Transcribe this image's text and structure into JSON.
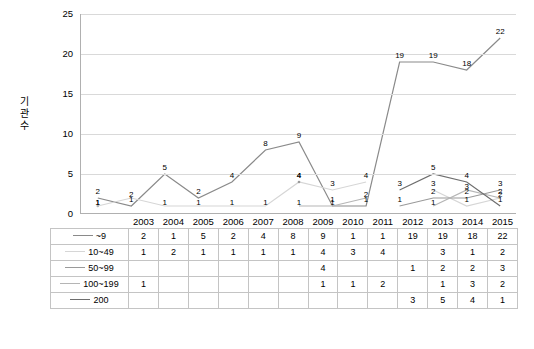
{
  "chart_data": {
    "type": "line",
    "title": "",
    "xlabel": "",
    "ylabel": "기관 수",
    "ylim": [
      0,
      25
    ],
    "yticks": [
      0,
      5,
      10,
      15,
      20,
      25
    ],
    "grid": true,
    "legend_position": "table-left",
    "categories": [
      "2003",
      "2004",
      "2005",
      "2006",
      "2007",
      "2008",
      "2009",
      "2010",
      "2011",
      "2012",
      "2013",
      "2014",
      "2015"
    ],
    "series": [
      {
        "name": "~9",
        "color": "#8a8a8a",
        "values": [
          2,
          1,
          5,
          2,
          4,
          8,
          9,
          1,
          1,
          19,
          19,
          18,
          22
        ],
        "labels": [
          "2",
          "1",
          "5",
          "2",
          "4",
          "8",
          "9",
          "1",
          "1",
          "19",
          "19",
          "18",
          "22"
        ]
      },
      {
        "name": "10~49",
        "color": "#d6d6d6",
        "values": [
          1,
          2,
          1,
          1,
          1,
          1,
          4,
          3,
          4,
          null,
          3,
          1,
          2
        ],
        "labels": [
          "1",
          "2",
          "1",
          "1",
          "1",
          "1",
          "4",
          "3",
          "4",
          "",
          "3",
          "1",
          "2"
        ]
      },
      {
        "name": "50~99",
        "color": "#9a9a9a",
        "values": [
          null,
          null,
          null,
          null,
          null,
          null,
          4,
          null,
          null,
          1,
          2,
          2,
          3
        ],
        "labels": [
          "",
          "",
          "",
          "",
          "",
          "",
          "4",
          "",
          "",
          "1",
          "2",
          "2",
          "3"
        ]
      },
      {
        "name": "100~199",
        "color": "#b5b5b5",
        "values": [
          1,
          null,
          null,
          null,
          null,
          null,
          1,
          1,
          2,
          null,
          1,
          3,
          2
        ],
        "labels": [
          "1",
          "",
          "",
          "",
          "",
          "",
          "1",
          "1",
          "2",
          "",
          "1",
          "3",
          "2"
        ]
      },
      {
        "name": "200",
        "color": "#6e6e6e",
        "values": [
          null,
          null,
          null,
          null,
          null,
          null,
          null,
          null,
          null,
          3,
          5,
          4,
          1
        ],
        "labels": [
          "",
          "",
          "",
          "",
          "",
          "",
          "",
          "",
          "",
          "3",
          "5",
          "4",
          "1"
        ]
      }
    ]
  },
  "table": {
    "row_headers": [
      "~9",
      "10~49",
      "50~99",
      "100~199",
      "200"
    ],
    "columns": [
      "2003",
      "2004",
      "2005",
      "2006",
      "2007",
      "2008",
      "2009",
      "2010",
      "2011",
      "2012",
      "2013",
      "2014",
      "2015"
    ],
    "rows": [
      [
        "2",
        "1",
        "5",
        "2",
        "4",
        "8",
        "9",
        "1",
        "1",
        "19",
        "19",
        "18",
        "22"
      ],
      [
        "1",
        "2",
        "1",
        "1",
        "1",
        "1",
        "4",
        "3",
        "4",
        "",
        "3",
        "1",
        "2"
      ],
      [
        "",
        "",
        "",
        "",
        "",
        "",
        "4",
        "",
        "",
        "1",
        "2",
        "2",
        "3"
      ],
      [
        "1",
        "",
        "",
        "",
        "",
        "",
        "1",
        "1",
        "2",
        "",
        "1",
        "3",
        "2"
      ],
      [
        "",
        "",
        "",
        "",
        "",
        "",
        "",
        "",
        "",
        "3",
        "5",
        "4",
        "1"
      ]
    ]
  }
}
